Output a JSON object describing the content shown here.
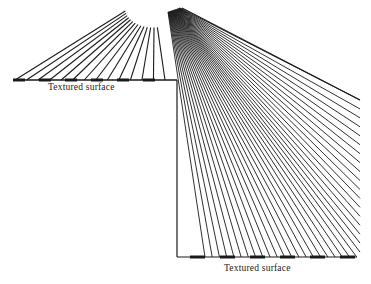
{
  "diagram": {
    "title": "",
    "labels": {
      "upper_surface": "Textured surface",
      "lower_surface": "Textured surface"
    },
    "left_fan": {
      "line_count": 14,
      "surface": {
        "x1": 13,
        "x2": 177,
        "y": 80
      }
    },
    "right_fan": {
      "apex": {
        "x": 182,
        "y": 8
      },
      "line_count": 40
    },
    "step": {
      "x": 177,
      "y_top": 80,
      "y_bottom": 257
    },
    "lower_surface": {
      "x1": 177,
      "x2": 357,
      "y": 257
    },
    "colors": {
      "ink": "#1a1a1a",
      "background": "#ffffff"
    }
  }
}
